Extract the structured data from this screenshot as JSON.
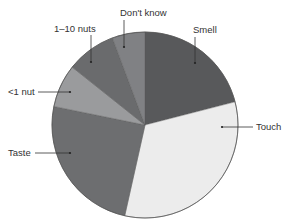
{
  "chart_data": {
    "type": "pie",
    "title": "",
    "start_angle_deg_from_north": 0,
    "direction": "clockwise",
    "slices": [
      {
        "label": "Smell",
        "value": 21,
        "color": "#58595b"
      },
      {
        "label": "Touch",
        "value": 32.5,
        "color": "#ececec"
      },
      {
        "label": "Taste",
        "value": 24.7,
        "color": "#6d6e70"
      },
      {
        "label": "<1 nut",
        "value": 7.5,
        "color": "#9a9b9d"
      },
      {
        "label": "1–10 nuts",
        "value": 8.6,
        "color": "#6a6b6d"
      },
      {
        "label": "Don't know",
        "value": 5.7,
        "color": "#808184"
      }
    ],
    "legend": "none (direct labels with leader lines)"
  },
  "labels": {
    "smell": "Smell",
    "touch": "Touch",
    "taste": "Taste",
    "lt1nut": "<1 nut",
    "nuts1to10": "1–10 nuts",
    "dontknow": "Don't know"
  }
}
